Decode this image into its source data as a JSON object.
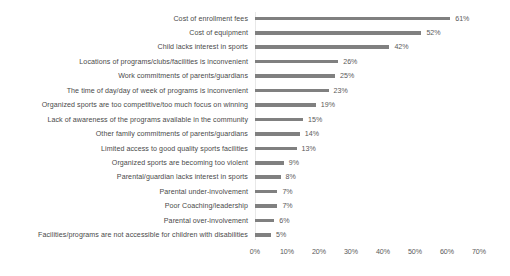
{
  "chart_data": {
    "type": "bar",
    "orientation": "horizontal",
    "title": "",
    "subtitle": "",
    "xlabel": "",
    "ylabel": "",
    "xlim": [
      0,
      70
    ],
    "xtick_labels": [
      "0%",
      "10%",
      "20%",
      "30%",
      "40%",
      "50%",
      "60%",
      "70%"
    ],
    "xticks": [
      0,
      10,
      20,
      30,
      40,
      50,
      60,
      70
    ],
    "grid": false,
    "legend": false,
    "bar_color": "#808080",
    "label_color": "#4a4a4a",
    "value_suffix": "%",
    "categories": [
      "Cost of enrollment fees",
      "Cost of equipment",
      "Child lacks interest in sports",
      "Locations of programs/clubs/facilities is inconvenient",
      "Work commitments of parents/guardians",
      "The time of day/day of week of programs is inconvenient",
      "Organized sports are too competitive/too much focus on winning",
      "Lack of awareness of the programs available in the community",
      "Other family commitments of parents/guardians",
      "Limited access to good quality sports facilities",
      "Organized sports are becoming too violent",
      "Parental/guardian lacks interest in sports",
      "Parental under-involvement",
      "Poor Coaching/leadership",
      "Parental over-involvement",
      "Facilities/programs are not accessible for children with disabilities"
    ],
    "values": [
      61,
      52,
      42,
      26,
      25,
      23,
      19,
      15,
      14,
      13,
      9,
      8,
      7,
      7,
      6,
      5
    ],
    "value_labels": [
      "61%",
      "52%",
      "42%",
      "26%",
      "25%",
      "23%",
      "19%",
      "15%",
      "14%",
      "13%",
      "9%",
      "8%",
      "7%",
      "7%",
      "6%",
      "5%"
    ]
  }
}
